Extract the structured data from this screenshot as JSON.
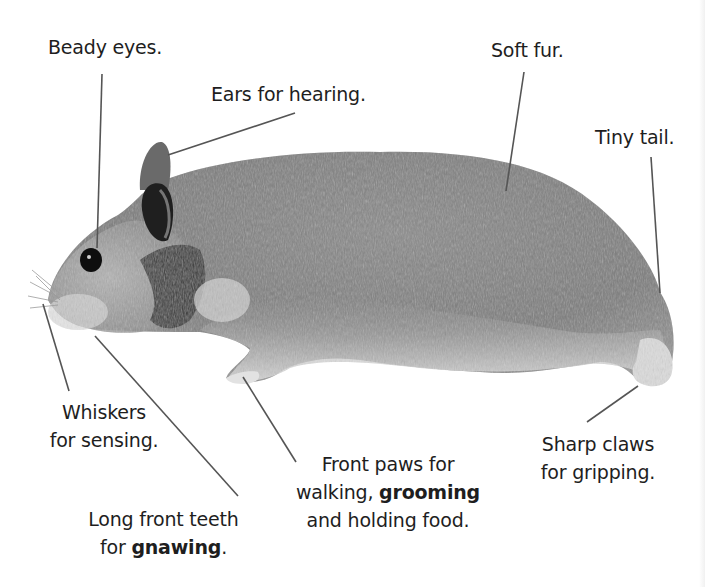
{
  "diagram": {
    "labels": {
      "eyes": "Beady eyes.",
      "ears": "Ears for hearing.",
      "fur": "Soft fur.",
      "tail": "Tiny tail.",
      "whiskers_line1": "Whiskers",
      "whiskers_line2": "for sensing.",
      "teeth_line1": "Long front teeth",
      "teeth_line2_pre": "for ",
      "teeth_line2_bold": "gnawing",
      "teeth_line2_post": ".",
      "paws_line1": "Front paws for",
      "paws_line2_pre": "walking, ",
      "paws_line2_bold": "grooming",
      "paws_line3": "and holding food.",
      "claws_line1": "Sharp claws",
      "claws_line2": "for gripping."
    },
    "colors": {
      "background": "#ffffff",
      "text": "#1e1e1e",
      "leader_line": "#555555",
      "fur_dark": "#6e6e6e",
      "fur_mid": "#8c8c8c",
      "fur_light": "#d6d6d6",
      "eye": "#111111"
    }
  }
}
